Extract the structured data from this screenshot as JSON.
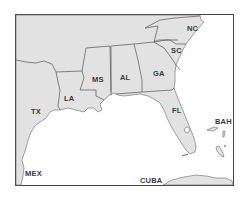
{
  "map": {
    "title": "Southeastern United States",
    "colors": {
      "land": "#e2e2e2",
      "water": "#ffffff",
      "border": "#555555",
      "frame": "#444444"
    },
    "labels": {
      "nc": "NC",
      "sc": "SC",
      "ga": "GA",
      "al": "AL",
      "ms": "MS",
      "la": "LA",
      "tx": "TX",
      "fl": "FL",
      "bah": "BAH",
      "mex": "MEX",
      "cuba": "CUBA"
    }
  }
}
